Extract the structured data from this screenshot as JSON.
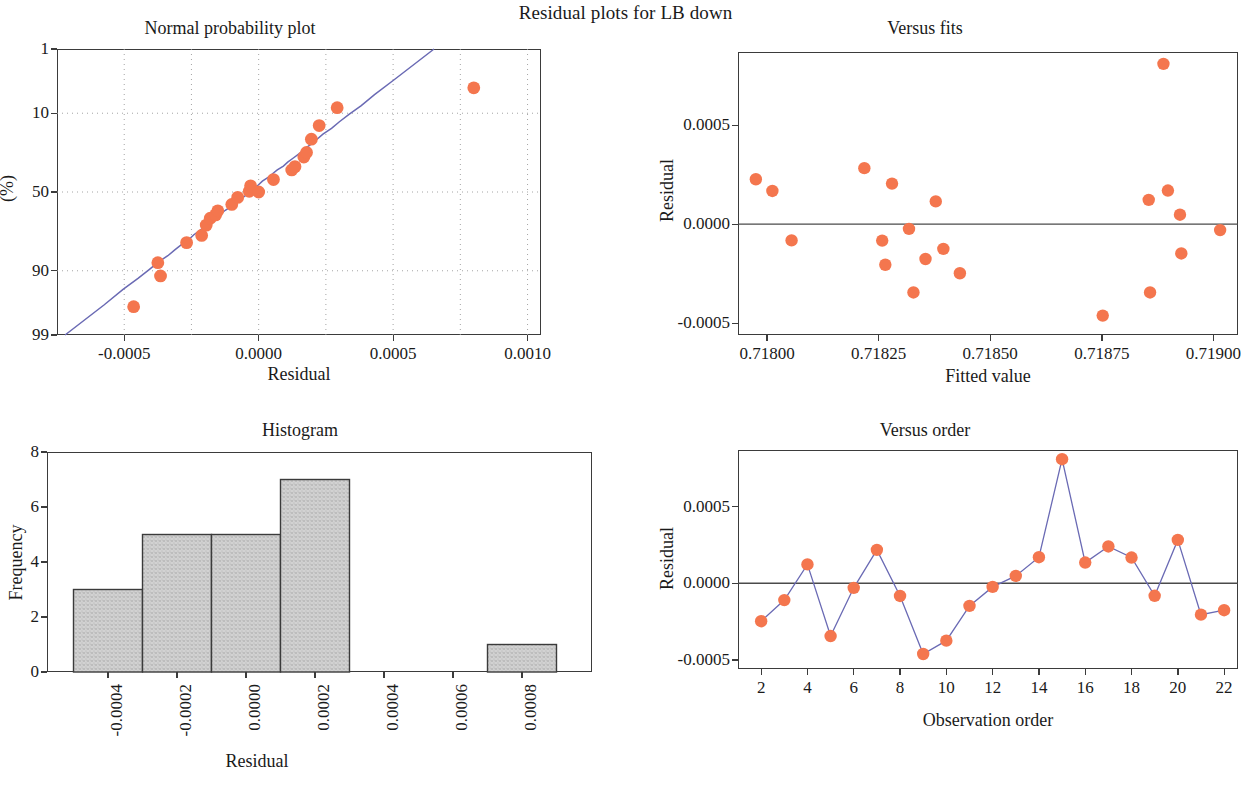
{
  "figure": {
    "main_title": "Residual plots for LB down",
    "marker_color": "#f4764e",
    "line_color": "#6a6ab4",
    "axis_color": "#3b3b3b",
    "bar_fill": "#c9c9c9",
    "bar_edge": "#3b3b3b",
    "grid_color": "#9a9a9a"
  },
  "panels": {
    "normal": {
      "title": "Normal probability plot",
      "xlabel": "Residual",
      "ylabel": "(%)",
      "xticks": [
        "-0.0005",
        "0.0000",
        "0.0005",
        "0.0010"
      ],
      "yticks": [
        "99",
        "90",
        "50",
        "10",
        "1"
      ]
    },
    "fits": {
      "title": "Versus fits",
      "xlabel": "Fitted value",
      "ylabel": "Residual",
      "xticks": [
        "0.71800",
        "0.71825",
        "0.71850",
        "0.71875",
        "0.71900"
      ],
      "yticks": [
        "0.0005",
        "0.0000",
        "-0.0005"
      ]
    },
    "histogram": {
      "title": "Histogram",
      "xlabel": "Residual",
      "ylabel": "Frequency",
      "xticks": [
        "-0.0004",
        "-0.0002",
        "0.0000",
        "0.0002",
        "0.0004",
        "0.0006",
        "0.0008"
      ],
      "yticks": [
        "8",
        "6",
        "4",
        "2",
        "0"
      ]
    },
    "order": {
      "title": "Versus order",
      "xlabel": "Observation order",
      "ylabel": "Residual",
      "xticks": [
        "2",
        "4",
        "6",
        "8",
        "10",
        "12",
        "14",
        "16",
        "18",
        "20",
        "22"
      ],
      "yticks": [
        "0.0005",
        "0.0000",
        "-0.0005"
      ]
    }
  },
  "chart_data": [
    {
      "type": "scatter",
      "id": "normal-probability-plot",
      "title": "Normal probability plot",
      "xlabel": "Residual",
      "ylabel": "(%)",
      "xlim": [
        -0.00075,
        0.00105
      ],
      "ylim_percent": [
        1,
        99
      ],
      "yscale": "probit",
      "xticks": [
        -0.0005,
        0.0,
        0.0005,
        0.001
      ],
      "yticks": [
        1,
        10,
        50,
        90,
        99
      ],
      "grid": true,
      "reference_line": {
        "color": "#6a6ab4",
        "x": [
          -0.00072,
          0.00065
        ],
        "percent": [
          1,
          99
        ]
      },
      "points": [
        {
          "x": -0.000465,
          "percent": 3.1
        },
        {
          "x": -0.000375,
          "percent": 12.5
        },
        {
          "x": -0.000365,
          "percent": 8.6
        },
        {
          "x": -0.000268,
          "percent": 20.5
        },
        {
          "x": -0.000212,
          "percent": 24.0
        },
        {
          "x": -0.000195,
          "percent": 29.5
        },
        {
          "x": -0.00018,
          "percent": 33.5
        },
        {
          "x": -0.00016,
          "percent": 35.5
        },
        {
          "x": -0.000152,
          "percent": 38.0
        },
        {
          "x": -0.0001,
          "percent": 42.0
        },
        {
          "x": -7.8e-05,
          "percent": 46.5
        },
        {
          "x": -3.5e-05,
          "percent": 50.5
        },
        {
          "x": -3e-05,
          "percent": 54.0
        },
        {
          "x": 0.0,
          "percent": 50.0
        },
        {
          "x": 5.5e-05,
          "percent": 58.0
        },
        {
          "x": 0.000123,
          "percent": 64.0
        },
        {
          "x": 0.000135,
          "percent": 66.0
        },
        {
          "x": 0.000168,
          "percent": 71.5
        },
        {
          "x": 0.000178,
          "percent": 74.0
        },
        {
          "x": 0.000196,
          "percent": 80.5
        },
        {
          "x": 0.000225,
          "percent": 86.0
        },
        {
          "x": 0.000292,
          "percent": 91.5
        },
        {
          "x": 0.0008,
          "percent": 95.5
        }
      ]
    },
    {
      "type": "scatter",
      "id": "versus-fits",
      "title": "Versus fits",
      "xlabel": "Fitted value",
      "ylabel": "Residual",
      "xlim": [
        0.717935,
        0.719055
      ],
      "ylim": [
        -0.00056,
        0.00087
      ],
      "xticks": [
        0.718,
        0.71825,
        0.7185,
        0.71875,
        0.719
      ],
      "yticks": [
        0.0005,
        0.0,
        -0.0005
      ],
      "grid": false,
      "zero_line": 0.0,
      "points": [
        {
          "x": 0.717975,
          "y": 0.000227
        },
        {
          "x": 0.718012,
          "y": 0.000168
        },
        {
          "x": 0.718055,
          "y": -8.2e-05
        },
        {
          "x": 0.718218,
          "y": 0.000283
        },
        {
          "x": 0.718258,
          "y": -8.3e-05
        },
        {
          "x": 0.718265,
          "y": -0.000205
        },
        {
          "x": 0.71828,
          "y": 0.000205
        },
        {
          "x": 0.718318,
          "y": -2.4e-05
        },
        {
          "x": 0.718328,
          "y": -0.000345
        },
        {
          "x": 0.718355,
          "y": -0.000176
        },
        {
          "x": 0.718378,
          "y": 0.000115
        },
        {
          "x": 0.718395,
          "y": -0.000125
        },
        {
          "x": 0.718432,
          "y": -0.000248
        },
        {
          "x": 0.718752,
          "y": -0.000462
        },
        {
          "x": 0.718855,
          "y": 0.000123
        },
        {
          "x": 0.718858,
          "y": -0.000345
        },
        {
          "x": 0.718888,
          "y": 0.00081
        },
        {
          "x": 0.718898,
          "y": 0.00017
        },
        {
          "x": 0.718925,
          "y": 4.8e-05
        },
        {
          "x": 0.718928,
          "y": -0.000148
        },
        {
          "x": 0.719015,
          "y": -3e-05
        }
      ]
    },
    {
      "type": "bar",
      "id": "histogram",
      "title": "Histogram",
      "xlabel": "Residual",
      "ylabel": "Frequency",
      "categories": [
        "-0.0004",
        "-0.0002",
        "0.0000",
        "0.0002",
        "0.0004",
        "0.0006",
        "0.0008"
      ],
      "bin_centers": [
        -0.0004,
        -0.0002,
        0.0,
        0.0002,
        0.0004,
        0.0006,
        0.0008
      ],
      "values": [
        3,
        5,
        5,
        7,
        0,
        0,
        1
      ],
      "ylim": [
        0,
        8
      ],
      "yticks": [
        0,
        2,
        4,
        6,
        8
      ],
      "grid": false
    },
    {
      "type": "line",
      "id": "versus-order",
      "title": "Versus order",
      "xlabel": "Observation order",
      "ylabel": "Residual",
      "x": [
        2,
        3,
        4,
        5,
        6,
        7,
        8,
        9,
        10,
        11,
        12,
        13,
        14,
        15,
        16,
        17,
        18,
        19,
        20,
        21,
        22
      ],
      "values": [
        -0.000248,
        -0.00011,
        0.000123,
        -0.000345,
        -3e-05,
        0.000218,
        -8.3e-05,
        -0.000462,
        -0.000375,
        -0.000148,
        -2.4e-05,
        4.8e-05,
        0.00017,
        0.00081,
        0.000135,
        0.00024,
        0.000168,
        -8.2e-05,
        0.000283,
        -0.000205,
        -0.000176
      ],
      "xlim": [
        1,
        22.6
      ],
      "ylim": [
        -0.00056,
        0.00087
      ],
      "xticks": [
        2,
        4,
        6,
        8,
        10,
        12,
        14,
        16,
        18,
        20,
        22
      ],
      "yticks": [
        0.0005,
        0.0,
        -0.0005
      ],
      "zero_line": 0.0,
      "markers": true,
      "grid": false
    }
  ]
}
